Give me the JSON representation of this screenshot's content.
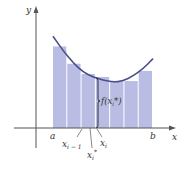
{
  "figure": {
    "axis_labels": {
      "x": "x",
      "y": "y"
    },
    "point_labels": {
      "a": "a",
      "b": "b",
      "x_im1": "x",
      "x_im1_sub": "i − 1",
      "x_i": "x",
      "x_i_sub": "i",
      "x_star": "x",
      "x_star_sub": "i",
      "x_star_sup": "*",
      "f_label": "f(x",
      "f_label_sub": "i",
      "f_label_tail": "*)"
    },
    "colors": {
      "rect_fill": "#b9bde3",
      "curve": "#4a4f8a",
      "axis": "#555555"
    },
    "rectangles": {
      "count": 7,
      "heights_relative": [
        0.8,
        0.63,
        0.53,
        0.5,
        0.46,
        0.46,
        0.56
      ],
      "highlight_index": 3
    },
    "curve_samples_relative": [
      [
        0.0,
        0.9
      ],
      [
        0.1,
        0.76
      ],
      [
        0.2,
        0.64
      ],
      [
        0.3,
        0.55
      ],
      [
        0.4,
        0.5
      ],
      [
        0.5,
        0.47
      ],
      [
        0.6,
        0.45
      ],
      [
        0.7,
        0.46
      ],
      [
        0.8,
        0.51
      ],
      [
        0.9,
        0.58
      ],
      [
        1.0,
        0.68
      ]
    ]
  }
}
